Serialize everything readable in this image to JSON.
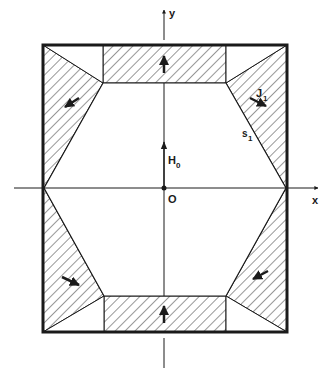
{
  "diagram": {
    "axes": {
      "x_label": "x",
      "y_label": "y",
      "origin_label": "O"
    },
    "labels": {
      "field": "H",
      "field_sub": "0",
      "current": "J",
      "current_sub": "1",
      "surface": "s",
      "surface_sub": "1"
    },
    "colors": {
      "line": "#1a1a1a",
      "background": "#ffffff"
    },
    "geometry": {
      "outer_rect": [
        43,
        45,
        287,
        332
      ],
      "top_rect": [
        103,
        45,
        226,
        83
      ],
      "bottom_rect": [
        104,
        296,
        226,
        332
      ],
      "hexagon": [
        [
          103,
          83
        ],
        [
          226,
          83
        ],
        [
          286,
          188
        ],
        [
          226,
          296
        ],
        [
          104,
          296
        ],
        [
          44,
          188
        ]
      ],
      "origin": [
        164,
        188
      ]
    }
  }
}
